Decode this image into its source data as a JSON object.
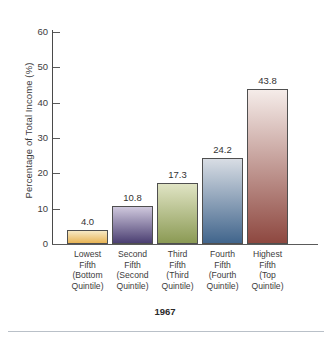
{
  "chart_data": {
    "type": "bar",
    "title": "",
    "caption": "1967",
    "xlabel": "",
    "ylabel": "Percentage of Total Income (%)",
    "ylim": [
      0,
      60
    ],
    "yticks": [
      0,
      10,
      20,
      30,
      40,
      50,
      60
    ],
    "ytick_labels": [
      "0",
      "10",
      "20",
      "30",
      "40",
      "50",
      "60"
    ],
    "grid": false,
    "legend": "none",
    "categories": [
      "Lowest Fifth (Bottom Quintile)",
      "Second Fifth (Second Quintile)",
      "Third Fifth (Third Quintile)",
      "Fourth Fifth (Fourth Quintile)",
      "Highest Fifth (Top Quintile)"
    ],
    "category_lines": [
      [
        "Lowest",
        "Fifth",
        "(Bottom",
        "Quintile)"
      ],
      [
        "Second",
        "Fifth",
        "(Second",
        "Quintile)"
      ],
      [
        "Third",
        "Fifth",
        "(Third",
        "Quintile)"
      ],
      [
        "Fourth",
        "Fifth",
        "(Fourth",
        "Quintile)"
      ],
      [
        "Highest",
        "Fifth",
        "(Top",
        "Quintile)"
      ]
    ],
    "values": [
      4.0,
      10.8,
      17.3,
      24.2,
      43.8
    ],
    "value_labels": [
      "4.0",
      "10.8",
      "17.3",
      "24.2",
      "43.8"
    ],
    "bar_colors_top": [
      "#f7e9c4",
      "#cfc8dd",
      "#e0e4c4",
      "#d8dde4",
      "#f5ece9"
    ],
    "bar_colors_bottom": [
      "#e8b455",
      "#4b3f72",
      "#8b9a54",
      "#41658c",
      "#8e4840"
    ],
    "bar_outline_color": "#4f4f4f",
    "axis_color": "#5a5a5a",
    "text_color": "#3c3c3c"
  },
  "bars": [
    {
      "label_lines": [
        "Lowest",
        "Fifth",
        "(Bottom",
        "Quintile)"
      ],
      "value_label": "4.0",
      "value": 4.0,
      "color_top": "#f7e9c4",
      "color_bottom": "#e8b455"
    },
    {
      "label_lines": [
        "Second",
        "Fifth",
        "(Second",
        "Quintile)"
      ],
      "value_label": "10.8",
      "value": 10.8,
      "color_top": "#cfc8dd",
      "color_bottom": "#4b3f72"
    },
    {
      "label_lines": [
        "Third",
        "Fifth",
        "(Third",
        "Quintile)"
      ],
      "value_label": "17.3",
      "value": 17.3,
      "color_top": "#e0e4c4",
      "color_bottom": "#8b9a54"
    },
    {
      "label_lines": [
        "Fourth",
        "Fifth",
        "(Fourth",
        "Quintile)"
      ],
      "value_label": "24.2",
      "value": 24.2,
      "color_top": "#d8dde4",
      "color_bottom": "#41658c"
    },
    {
      "label_lines": [
        "Highest",
        "Fifth",
        "(Top",
        "Quintile)"
      ],
      "value_label": "43.8",
      "value": 43.8,
      "color_top": "#f5ece9",
      "color_bottom": "#8e4840"
    }
  ],
  "axis": {
    "y_title": "Percentage of Total Income (%)",
    "y_tick_labels": [
      "60",
      "50",
      "40",
      "30",
      "20",
      "10",
      "0"
    ]
  },
  "caption": {
    "text": "1967"
  }
}
